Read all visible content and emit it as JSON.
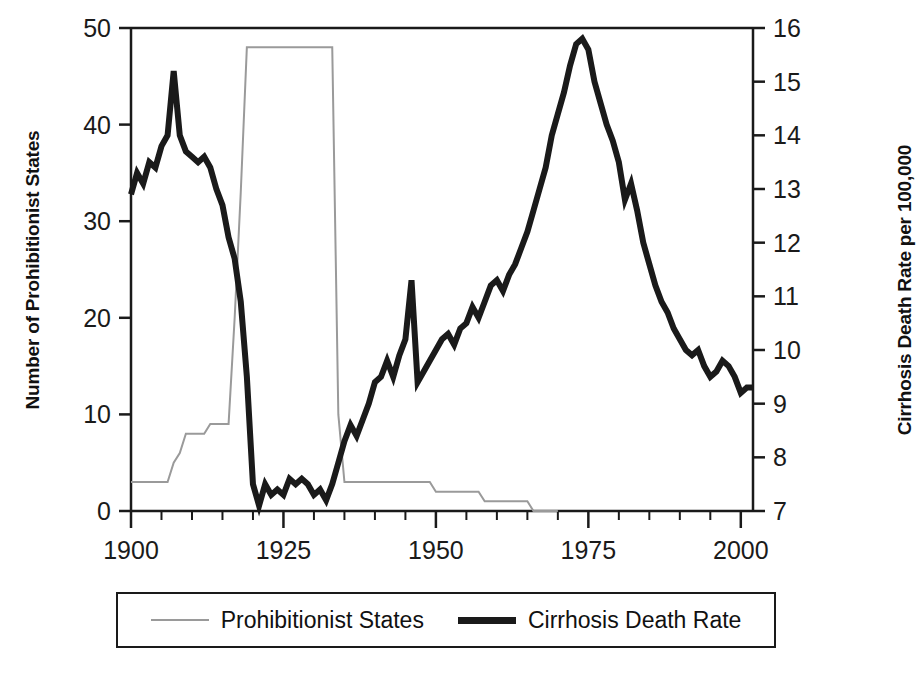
{
  "chart_data": {
    "type": "line",
    "title": "",
    "xlabel": "",
    "grid": false,
    "legend_position": "bottom",
    "x_axis": {
      "label": "",
      "ticks": [
        "1900",
        "1925",
        "1950",
        "1975",
        "2000"
      ],
      "tick_values": [
        1900,
        1925,
        1950,
        1975,
        2000
      ],
      "minor_tick_interval": 5,
      "xlim": [
        1900,
        2002
      ]
    },
    "y_axis_left": {
      "label": "Number of Prohibitionist States",
      "ticks": [
        "0",
        "10",
        "20",
        "30",
        "40",
        "50"
      ],
      "tick_values": [
        0,
        10,
        20,
        30,
        40,
        50
      ],
      "ylim": [
        0,
        50
      ]
    },
    "y_axis_right": {
      "label": "Cirrhosis Death Rate per 100,000",
      "ticks": [
        "7",
        "8",
        "9",
        "10",
        "11",
        "12",
        "13",
        "14",
        "15",
        "16"
      ],
      "tick_values": [
        7,
        8,
        9,
        10,
        11,
        12,
        13,
        14,
        15,
        16
      ],
      "ylim": [
        7,
        16
      ]
    },
    "series": [
      {
        "name": "Prohibitionist States",
        "axis": "left",
        "color": "#9a9a9a",
        "linewidth": 2,
        "x": [
          1900,
          1901,
          1902,
          1903,
          1904,
          1905,
          1906,
          1907,
          1908,
          1909,
          1910,
          1911,
          1912,
          1913,
          1914,
          1915,
          1916,
          1917,
          1918,
          1919,
          1920,
          1921,
          1922,
          1923,
          1924,
          1925,
          1926,
          1927,
          1928,
          1929,
          1930,
          1931,
          1932,
          1933,
          1934,
          1935,
          1936,
          1937,
          1938,
          1939,
          1940,
          1941,
          1942,
          1943,
          1944,
          1945,
          1946,
          1947,
          1948,
          1949,
          1950,
          1951,
          1952,
          1953,
          1954,
          1955,
          1956,
          1957,
          1958,
          1959,
          1960,
          1961,
          1962,
          1963,
          1964,
          1965,
          1966,
          1967,
          1968,
          1969,
          1970
        ],
        "values": [
          3,
          3,
          3,
          3,
          3,
          3,
          3,
          5,
          6,
          8,
          8,
          8,
          8,
          9,
          9,
          9,
          9,
          20,
          33,
          48,
          48,
          48,
          48,
          48,
          48,
          48,
          48,
          48,
          48,
          48,
          48,
          48,
          48,
          48,
          10,
          3,
          3,
          3,
          3,
          3,
          3,
          3,
          3,
          3,
          3,
          3,
          3,
          3,
          3,
          3,
          2,
          2,
          2,
          2,
          2,
          2,
          2,
          2,
          1,
          1,
          1,
          1,
          1,
          1,
          1,
          1,
          0,
          0,
          0,
          0,
          0
        ]
      },
      {
        "name": "Cirrhosis Death Rate",
        "axis": "right",
        "color": "#1a1a1a",
        "linewidth": 6,
        "x": [
          1900,
          1901,
          1902,
          1903,
          1904,
          1905,
          1906,
          1907,
          1908,
          1909,
          1910,
          1911,
          1912,
          1913,
          1914,
          1915,
          1916,
          1917,
          1918,
          1919,
          1920,
          1921,
          1922,
          1923,
          1924,
          1925,
          1926,
          1927,
          1928,
          1929,
          1930,
          1931,
          1932,
          1933,
          1934,
          1935,
          1936,
          1937,
          1938,
          1939,
          1940,
          1941,
          1942,
          1943,
          1944,
          1945,
          1946,
          1947,
          1948,
          1949,
          1950,
          1951,
          1952,
          1953,
          1954,
          1955,
          1956,
          1957,
          1958,
          1959,
          1960,
          1961,
          1962,
          1963,
          1964,
          1965,
          1966,
          1967,
          1968,
          1969,
          1970,
          1971,
          1972,
          1973,
          1974,
          1975,
          1976,
          1977,
          1978,
          1979,
          1980,
          1981,
          1982,
          1983,
          1984,
          1985,
          1986,
          1987,
          1988,
          1989,
          1990,
          1991,
          1992,
          1993,
          1994,
          1995,
          1996,
          1997,
          1998,
          1999,
          2000,
          2001,
          2002
        ],
        "values": [
          12.9,
          13.3,
          13.1,
          13.5,
          13.4,
          13.8,
          14.0,
          15.2,
          14.0,
          13.7,
          13.6,
          13.5,
          13.6,
          13.4,
          13.0,
          12.7,
          12.1,
          11.7,
          10.9,
          9.5,
          7.5,
          7.1,
          7.5,
          7.3,
          7.4,
          7.3,
          7.6,
          7.5,
          7.6,
          7.5,
          7.3,
          7.4,
          7.2,
          7.5,
          7.9,
          8.3,
          8.6,
          8.4,
          8.7,
          9.0,
          9.4,
          9.5,
          9.8,
          9.5,
          9.9,
          10.2,
          11.3,
          9.4,
          9.6,
          9.8,
          10.0,
          10.2,
          10.3,
          10.1,
          10.4,
          10.5,
          10.8,
          10.6,
          10.9,
          11.2,
          11.3,
          11.1,
          11.4,
          11.6,
          11.9,
          12.2,
          12.6,
          13.0,
          13.4,
          14.0,
          14.4,
          14.8,
          15.3,
          15.7,
          15.8,
          15.6,
          15.0,
          14.6,
          14.2,
          13.9,
          13.5,
          12.8,
          13.1,
          12.6,
          12.0,
          11.6,
          11.2,
          10.9,
          10.7,
          10.4,
          10.2,
          10.0,
          9.9,
          10.0,
          9.7,
          9.5,
          9.6,
          9.8,
          9.7,
          9.5,
          9.2,
          9.3,
          9.3
        ]
      }
    ]
  },
  "legend": {
    "entries": [
      {
        "label": "Prohibitionist States",
        "style": "thin-gray"
      },
      {
        "label": "Cirrhosis Death Rate",
        "style": "thick-black"
      }
    ]
  },
  "colors": {
    "prohibitionist_line": "#9a9a9a",
    "cirrhosis_line": "#1a1a1a",
    "axis": "#1a1a1a",
    "background": "#ffffff"
  }
}
